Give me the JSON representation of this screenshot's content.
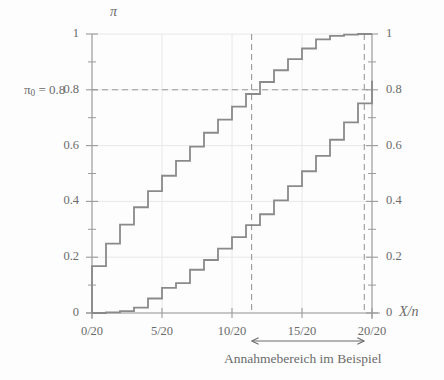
{
  "chart_data": {
    "type": "line",
    "title": "",
    "subtitle": "",
    "xlabel": "X/n",
    "ylabel": "π",
    "ylabel_right": "",
    "xlim": [
      0,
      20
    ],
    "ylim": [
      0,
      1
    ],
    "grid": true,
    "legend_position": "none",
    "x_ticks": [
      {
        "value": 0,
        "label": "0/20"
      },
      {
        "value": 5,
        "label": "5/20"
      },
      {
        "value": 10,
        "label": "10/20"
      },
      {
        "value": 15,
        "label": "15/20"
      },
      {
        "value": 20,
        "label": "20/20"
      }
    ],
    "x_minor_ticks": [
      1,
      2,
      3,
      4,
      6,
      7,
      8,
      9,
      11,
      12,
      13,
      14,
      16,
      17,
      18,
      19
    ],
    "y_ticks_left": [
      {
        "value": 1,
        "label": "1"
      },
      {
        "value": 0.8,
        "label": "0.8"
      },
      {
        "value": 0.6,
        "label": "0.6"
      },
      {
        "value": 0.4,
        "label": "0.4"
      },
      {
        "value": 0.2,
        "label": "0.2"
      },
      {
        "value": 0,
        "label": "0"
      }
    ],
    "y_ticks_right": [
      {
        "value": 1,
        "label": "1"
      },
      {
        "value": 0.8,
        "label": "0.8"
      },
      {
        "value": 0.6,
        "label": "0.6"
      },
      {
        "value": 0.4,
        "label": "0.4"
      },
      {
        "value": 0.2,
        "label": "0.2"
      },
      {
        "value": 0,
        "label": "0"
      }
    ],
    "y_minor_ticks": [
      0.1,
      0.3,
      0.5,
      0.7,
      0.9
    ],
    "x": [
      0,
      1,
      2,
      3,
      4,
      5,
      6,
      7,
      8,
      9,
      10,
      11,
      12,
      13,
      14,
      15,
      16,
      17,
      18,
      19,
      20
    ],
    "series": [
      {
        "name": "upper confidence bound",
        "style": "step",
        "color": "#8a8a8a",
        "values": [
          0.168,
          0.249,
          0.317,
          0.379,
          0.437,
          0.492,
          0.545,
          0.596,
          0.646,
          0.693,
          0.74,
          0.785,
          0.828,
          0.87,
          0.91,
          0.948,
          0.981,
          0.993,
          0.998,
          1.0,
          1.0
        ]
      },
      {
        "name": "lower confidence bound",
        "style": "step",
        "color": "#8a8a8a",
        "values": [
          0.0,
          0.002,
          0.007,
          0.019,
          0.052,
          0.09,
          0.107,
          0.155,
          0.19,
          0.231,
          0.272,
          0.315,
          0.354,
          0.404,
          0.455,
          0.508,
          0.563,
          0.621,
          0.683,
          0.751,
          0.832
        ]
      }
    ],
    "reference_lines": [
      {
        "name": "pi0-horizontal",
        "orientation": "horizontal",
        "value": 0.8,
        "style": "dashed",
        "label": "π₀ = 0.8"
      },
      {
        "name": "acceptance-left",
        "orientation": "vertical",
        "value": 11.4,
        "style": "dashed"
      },
      {
        "name": "acceptance-right",
        "orientation": "vertical",
        "value": 19.45,
        "style": "dashed"
      }
    ],
    "annotations": [
      {
        "name": "acceptance-range-arrow",
        "text": "Annahmebereich im Beispiel",
        "x_start": 11.4,
        "x_end": 19.45,
        "arrow": "double-headed"
      }
    ]
  },
  "labels": {
    "y_axis_symbol": "π",
    "x_axis_symbol": "X/n",
    "pi0_prefix": "π",
    "pi0_subscript": "0",
    "pi0_equals": " = 0.8",
    "annotation_text": "Annahmebereich im Beispiel",
    "x_axis_numerator": "X",
    "x_axis_slash": "/",
    "x_axis_denominator": "n"
  },
  "colors": {
    "curve": "#8a8a8a",
    "axis": "#9a9a9a",
    "grid": "#e8e8e8",
    "dashed": "#9a9a9a",
    "text": "#6b6b6b",
    "background": "#fdfdfd"
  }
}
